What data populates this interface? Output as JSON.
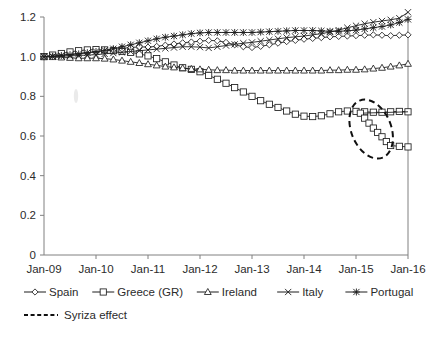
{
  "chart_data": {
    "type": "line",
    "title": "",
    "subtitle": "",
    "xlabel": "",
    "ylabel": "",
    "xlim": [
      "Jan-09",
      "Jan-16"
    ],
    "ylim": [
      0,
      1.2
    ],
    "grid": false,
    "legend_position": "bottom",
    "y_ticks": [
      "0",
      "0.2",
      "0.4",
      "0.6",
      "0.8",
      "1.0",
      "1.2"
    ],
    "y_tick_values": [
      0,
      0.2,
      0.4,
      0.6,
      0.8,
      1.0,
      1.2
    ],
    "x_ticks": [
      "Jan-09",
      "Jan-10",
      "Jan-11",
      "Jan-12",
      "Jan-13",
      "Jan-14",
      "Jan-15",
      "Jan-16"
    ],
    "x_tick_values": [
      0,
      12,
      24,
      36,
      48,
      60,
      72,
      84
    ],
    "x_points": [
      0,
      2,
      4,
      6,
      8,
      10,
      12,
      14,
      16,
      18,
      20,
      22,
      24,
      26,
      28,
      30,
      32,
      34,
      36,
      38,
      40,
      42,
      44,
      46,
      48,
      50,
      52,
      54,
      56,
      58,
      60,
      62,
      64,
      66,
      68,
      70,
      72,
      74,
      76,
      78,
      80,
      82,
      84
    ],
    "series": [
      {
        "name": "Spain",
        "marker": "diamond",
        "values": [
          1.0,
          1.004,
          1.008,
          1.012,
          1.016,
          1.02,
          1.024,
          1.03,
          1.036,
          1.042,
          1.046,
          1.05,
          1.048,
          1.052,
          1.058,
          1.064,
          1.07,
          1.074,
          1.078,
          1.082,
          1.08,
          1.072,
          1.06,
          1.05,
          1.046,
          1.052,
          1.06,
          1.068,
          1.076,
          1.082,
          1.088,
          1.092,
          1.096,
          1.1,
          1.102,
          1.104,
          1.106,
          1.108,
          1.11,
          1.108,
          1.106,
          1.108,
          1.11
        ]
      },
      {
        "name": "Greece (GR)",
        "marker": "square",
        "values": [
          1.0,
          1.008,
          1.016,
          1.024,
          1.03,
          1.034,
          1.036,
          1.034,
          1.03,
          1.026,
          1.022,
          1.014,
          1.004,
          0.99,
          0.974,
          0.958,
          0.944,
          0.936,
          0.924,
          0.906,
          0.886,
          0.866,
          0.844,
          0.822,
          0.8,
          0.778,
          0.76,
          0.744,
          0.726,
          0.71,
          0.7,
          0.698,
          0.702,
          0.712,
          0.722,
          0.726,
          0.724,
          0.722,
          0.72,
          0.72,
          0.722,
          0.724,
          0.722
        ]
      },
      {
        "name": "Ireland",
        "marker": "triangle",
        "values": [
          1.0,
          0.998,
          0.996,
          0.994,
          0.992,
          0.992,
          0.992,
          0.99,
          0.986,
          0.98,
          0.974,
          0.968,
          0.962,
          0.956,
          0.95,
          0.946,
          0.942,
          0.938,
          0.936,
          0.934,
          0.932,
          0.932,
          0.93,
          0.93,
          0.93,
          0.93,
          0.93,
          0.93,
          0.93,
          0.93,
          0.93,
          0.93,
          0.93,
          0.932,
          0.932,
          0.934,
          0.934,
          0.936,
          0.94,
          0.944,
          0.95,
          0.956,
          0.964
        ]
      },
      {
        "name": "Italy",
        "marker": "cross",
        "values": [
          1.0,
          1.0,
          1.002,
          1.004,
          1.006,
          1.008,
          1.01,
          1.014,
          1.018,
          1.022,
          1.026,
          1.03,
          1.034,
          1.038,
          1.042,
          1.046,
          1.05,
          1.05,
          1.048,
          1.044,
          1.05,
          1.056,
          1.062,
          1.068,
          1.072,
          1.078,
          1.084,
          1.09,
          1.096,
          1.1,
          1.104,
          1.11,
          1.116,
          1.124,
          1.134,
          1.146,
          1.156,
          1.166,
          1.174,
          1.18,
          1.186,
          1.194,
          1.224
        ]
      },
      {
        "name": "Portugal",
        "marker": "asterisk",
        "values": [
          1.0,
          1.002,
          1.006,
          1.01,
          1.014,
          1.02,
          1.026,
          1.032,
          1.04,
          1.05,
          1.06,
          1.07,
          1.08,
          1.09,
          1.098,
          1.104,
          1.11,
          1.116,
          1.12,
          1.122,
          1.122,
          1.122,
          1.122,
          1.122,
          1.122,
          1.124,
          1.126,
          1.128,
          1.13,
          1.132,
          1.132,
          1.132,
          1.13,
          1.128,
          1.128,
          1.13,
          1.134,
          1.14,
          1.146,
          1.152,
          1.16,
          1.172,
          1.188
        ]
      }
    ],
    "annotations": [
      {
        "name": "syriza-effect-ellipse",
        "type": "ellipse",
        "label": "Syriza effect",
        "style": "dashed",
        "center_x": 75.5,
        "center_y": 0.635,
        "radius_x": 4.6,
        "radius_y": 0.155,
        "rotation_deg": -22
      }
    ],
    "highlight_segment": {
      "series": "Greece (GR)",
      "x_points": [
        73,
        74,
        75,
        76,
        77,
        78,
        79,
        80,
        82,
        84
      ],
      "values": [
        0.715,
        0.69,
        0.665,
        0.64,
        0.618,
        0.596,
        0.572,
        0.552,
        0.548,
        0.545
      ]
    }
  },
  "legend": {
    "row1": [
      {
        "label": "Spain",
        "marker": "diamond"
      },
      {
        "label": "Greece (GR)",
        "marker": "square"
      },
      {
        "label": "Ireland",
        "marker": "triangle"
      },
      {
        "label": "Italy",
        "marker": "cross"
      },
      {
        "label": "Portugal",
        "marker": "asterisk"
      }
    ],
    "row2": [
      {
        "label": "Syriza effect",
        "marker": "dashed-line"
      }
    ]
  }
}
